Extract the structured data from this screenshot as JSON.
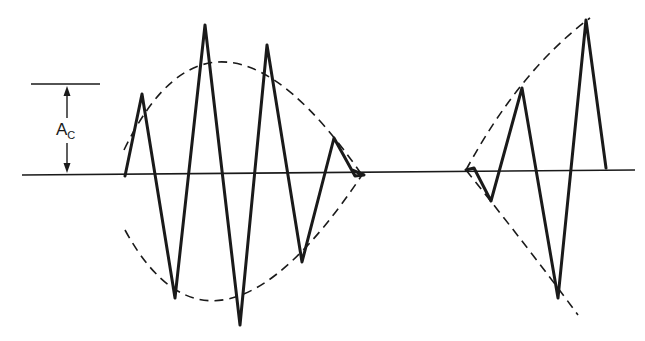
{
  "diagram": {
    "type": "amplitude-modulated waveform",
    "colors": {
      "stroke": "#1a1a1a",
      "background": "#ffffff"
    },
    "amplitude_label": {
      "main": "A",
      "subscript": "C"
    },
    "baseline": {
      "x1": 22,
      "y1": 175,
      "x2": 635,
      "y2": 170
    },
    "amplitude_marker": {
      "top_line": {
        "x1": 31,
        "y1": 84,
        "x2": 100,
        "y2": 84
      },
      "arrow_x": 67,
      "arrow_top": 86,
      "arrow_bottom": 173
    },
    "packets": [
      {
        "name": "left-wave-packet",
        "carrier_points": [
          [
            125,
            176
          ],
          [
            142,
            94
          ],
          [
            175,
            298
          ],
          [
            205,
            25
          ],
          [
            240,
            325
          ],
          [
            267,
            45
          ],
          [
            302,
            262
          ],
          [
            334,
            138
          ],
          [
            355,
            176
          ],
          [
            364,
            175
          ],
          [
            352,
            170
          ]
        ],
        "envelope_upper": "M 124 150 Q 215 -38 362 175",
        "envelope_lower": "M 125 230 Q 215 395 362 175"
      },
      {
        "name": "right-wave-packet",
        "carrier_points": [
          [
            466,
            170
          ],
          [
            474,
            168
          ],
          [
            491,
            201
          ],
          [
            522,
            88
          ],
          [
            558,
            298
          ],
          [
            586,
            20
          ],
          [
            606,
            168
          ]
        ],
        "envelope_upper": "M 466 170 Q 520 70 590 18",
        "envelope_lower": "M 466 170 Q 530 250 578 315"
      }
    ]
  }
}
